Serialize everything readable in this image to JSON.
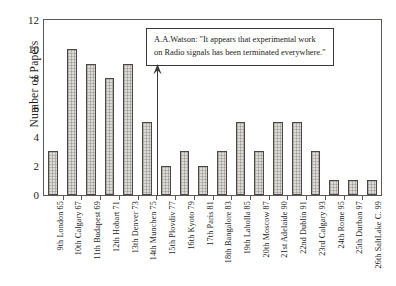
{
  "chart_data": {
    "type": "bar",
    "title": "",
    "xlabel": "",
    "ylabel": "Number of Papers",
    "ylim": [
      0,
      12
    ],
    "ytick_step": 2,
    "yticks": [
      0,
      2,
      4,
      6,
      8,
      10,
      12
    ],
    "grid": false,
    "legend": "none",
    "categories": [
      "9th London 65",
      "10th Calgary 67",
      "11th Budapest 69",
      "12th Hobart 71",
      "13th Denver 73",
      "14th Munchen 75",
      "15th Plovdiv 77",
      "16th Kyoto 79",
      "17th Paris 81",
      "18th Bangalore 83",
      "19th Laholla 85",
      "20th Moscow 87",
      "21st Adelaide 90",
      "22nd Dublin 91",
      "23rd Calgary 93",
      "24th Rome 95",
      "25th Durban 97",
      "26th SaltLake C. 99"
    ],
    "values": [
      3,
      10,
      9,
      8,
      9,
      5,
      2,
      3,
      2,
      3,
      5,
      3,
      5,
      5,
      3,
      1,
      1,
      1
    ],
    "annotations": [
      {
        "text_line_1": "A.A.Watson: \"It appears that experimental work",
        "text_line_2": "on Radio signals has been terminated everywhere.\"",
        "points_to_category": "14th Munchen 75"
      }
    ],
    "colors": {
      "bar_fill": "#dddbd8",
      "bar_edge": "#4b4745",
      "axis": "#5d5955",
      "text": "#1d1a18",
      "background": "#ffffff"
    }
  }
}
